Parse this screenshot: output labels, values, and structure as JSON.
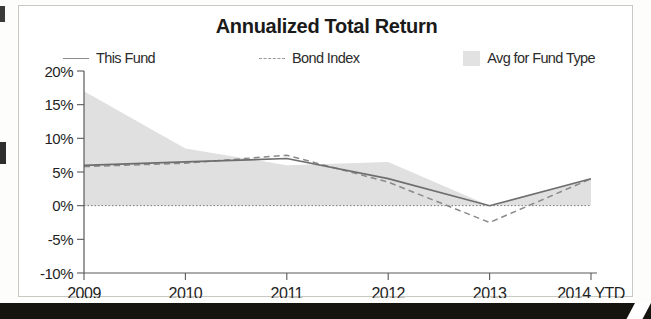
{
  "chart_data": {
    "type": "line",
    "title": "Annualized Total Return",
    "xlabel": "",
    "ylabel": "",
    "x": [
      "2009",
      "2010",
      "2011",
      "2012",
      "2013",
      "2014 YTD"
    ],
    "categories": [
      "2009",
      "2010",
      "2011",
      "2012",
      "2013",
      "2014 YTD"
    ],
    "ylim": [
      -10,
      20
    ],
    "ytick_labels": [
      "20%",
      "15%",
      "10%",
      "5%",
      "0%",
      "-5%",
      "-10%"
    ],
    "ytick_values": [
      20,
      15,
      10,
      5,
      0,
      -5,
      -10
    ],
    "grid": false,
    "legend_position": "top",
    "series": [
      {
        "name": "This Fund",
        "style": "solid-line",
        "color": "#6e6e6e",
        "values": [
          6.0,
          6.5,
          7.0,
          4.0,
          0.0,
          4.0
        ]
      },
      {
        "name": "Bond Index",
        "style": "dashed-line",
        "color": "#8a8a8a",
        "values": [
          5.8,
          6.3,
          7.5,
          3.5,
          -2.5,
          4.0
        ]
      },
      {
        "name": "Avg for Fund Type",
        "style": "shaded-area",
        "color": "#e0e0e0",
        "values": [
          17.0,
          8.5,
          6.0,
          6.5,
          0.0,
          4.0
        ]
      }
    ]
  },
  "chart": {
    "title": "Annualized Total Return",
    "legend": [
      {
        "label": "This Fund",
        "marker": "solid-line-swatch"
      },
      {
        "label": "Bond Index",
        "marker": "dashed-line-swatch"
      },
      {
        "label": "Avg for Fund Type",
        "marker": "area-swatch"
      }
    ],
    "y_axis": {
      "labels": [
        "20%",
        "15%",
        "10%",
        "5%",
        "0%",
        "-5%",
        "-10%"
      ]
    },
    "x_axis": {
      "labels": [
        "2009",
        "2010",
        "2011",
        "2012",
        "2013",
        "2014 YTD"
      ]
    }
  },
  "colors": {
    "area": "#e0e0e0",
    "fund_line": "#6e6e6e",
    "index_line": "#8a8a8a",
    "axis": "#5a5a5a",
    "text": "#1f1f1f"
  }
}
